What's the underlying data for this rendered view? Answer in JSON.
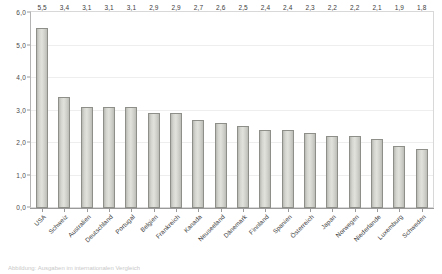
{
  "chart_data": {
    "type": "bar",
    "title": "",
    "subtitle": "",
    "xlabel": "",
    "ylabel": "",
    "ylim": [
      0,
      6
    ],
    "y_ticks": [
      "0,0",
      "1,0",
      "2,0",
      "3,0",
      "4,0",
      "5,0",
      "6,0"
    ],
    "y_tick_values": [
      0,
      1,
      2,
      3,
      4,
      5,
      6
    ],
    "grid": true,
    "legend": null,
    "decimal_separator": ",",
    "categories": [
      "USA",
      "Schweiz",
      "Australien",
      "Deutschland",
      "Portugal",
      "Belgien",
      "Frankreich",
      "Kanada",
      "Neuseeland",
      "Dänemark",
      "Finnland",
      "Spanien",
      "Österreich",
      "Japan",
      "Norwegen",
      "Niederlande",
      "Luxemburg",
      "Schweden"
    ],
    "values": [
      5.5,
      3.4,
      3.1,
      3.1,
      3.1,
      2.9,
      2.9,
      2.7,
      2.6,
      2.5,
      2.4,
      2.4,
      2.3,
      2.2,
      2.2,
      2.1,
      1.9,
      1.8
    ],
    "value_labels": [
      "5,5",
      "3,4",
      "3,1",
      "3,1",
      "3,1",
      "2,9",
      "2,9",
      "2,7",
      "2,6",
      "2,5",
      "2,4",
      "2,4",
      "2,3",
      "2,2",
      "2,2",
      "2,1",
      "1,9",
      "1,8"
    ],
    "colors": {
      "bar_fill": "#d8d8d3",
      "bar_border": "#8f8f8a",
      "gridline": "#eeeeee",
      "axis": "#9a9a9a",
      "text": "#3c3c3c",
      "frame": "#d8d8d8"
    }
  },
  "caption": {
    "text": "Abbildung: Ausgaben im internationalen Vergleich"
  }
}
